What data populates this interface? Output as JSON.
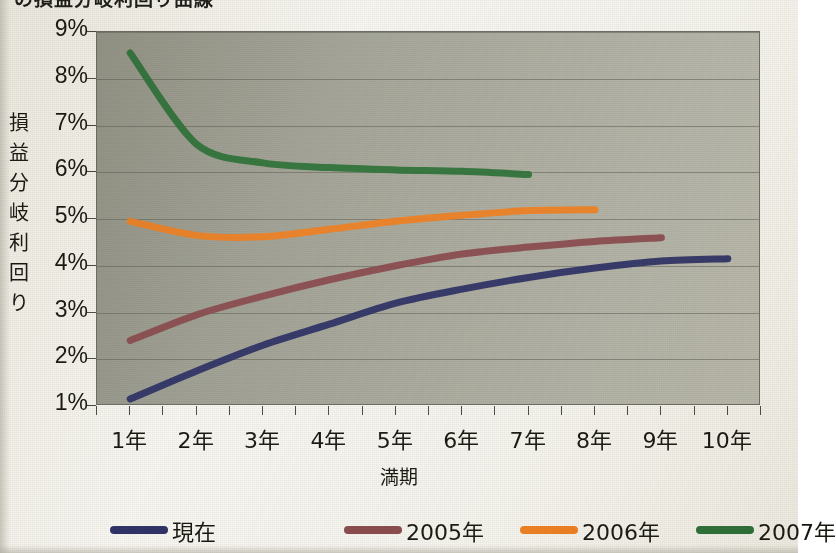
{
  "chart_data": {
    "type": "line",
    "title": "の損益分岐利回り曲線",
    "xlabel": "満期",
    "ylabel": "損益分岐利回り",
    "categories": [
      "1年",
      "2年",
      "3年",
      "4年",
      "5年",
      "6年",
      "7年",
      "8年",
      "9年",
      "10年"
    ],
    "x": [
      1,
      2,
      3,
      4,
      5,
      6,
      7,
      8,
      9,
      10
    ],
    "ylim": [
      1,
      9
    ],
    "yticks": [
      "1%",
      "2%",
      "3%",
      "4%",
      "5%",
      "6%",
      "7%",
      "8%",
      "9%"
    ],
    "ytick_values": [
      1,
      2,
      3,
      4,
      5,
      6,
      7,
      8,
      9
    ],
    "grid": true,
    "legend_position": "bottom",
    "series": [
      {
        "name": "現在",
        "color": "#2b2f66",
        "x": [
          1,
          2,
          3,
          4,
          5,
          6,
          7,
          8,
          9,
          10
        ],
        "values": [
          1.15,
          1.75,
          2.3,
          2.75,
          3.2,
          3.5,
          3.75,
          3.95,
          4.1,
          4.15
        ]
      },
      {
        "name": "2005年",
        "color": "#8c4a4f",
        "x": [
          1,
          2,
          3,
          4,
          5,
          6,
          7,
          8,
          9
        ],
        "values": [
          2.4,
          2.95,
          3.35,
          3.7,
          4.0,
          4.25,
          4.4,
          4.52,
          4.6
        ]
      },
      {
        "name": "2006年",
        "color": "#f58220",
        "x": [
          1,
          2,
          3,
          4,
          5,
          6,
          7,
          8
        ],
        "values": [
          4.95,
          4.65,
          4.62,
          4.78,
          4.95,
          5.08,
          5.18,
          5.2
        ]
      },
      {
        "name": "2007年",
        "color": "#2c7338",
        "x": [
          1,
          2,
          3,
          4,
          5,
          6,
          7
        ],
        "values": [
          8.55,
          6.6,
          6.2,
          6.1,
          6.05,
          6.02,
          5.95
        ]
      }
    ]
  },
  "legend": {
    "items": [
      {
        "label": "現在",
        "color": "#2b2f66"
      },
      {
        "label": "2005年",
        "color": "#8c4a4f"
      },
      {
        "label": "2006年",
        "color": "#f58220"
      },
      {
        "label": "2007年",
        "color": "#2c7338"
      }
    ]
  },
  "axes": {
    "y_title_chars": [
      "損",
      "益",
      "分",
      "岐",
      "利",
      "回",
      "り"
    ]
  }
}
